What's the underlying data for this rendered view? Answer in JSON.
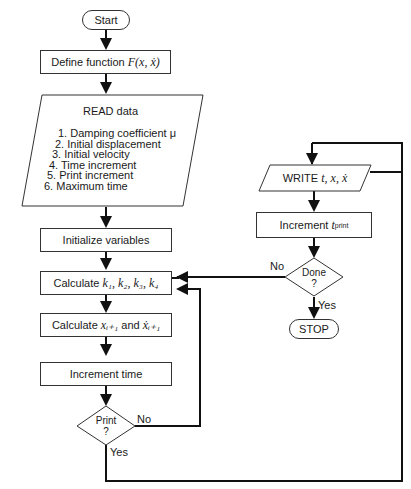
{
  "diagram": {
    "type": "flowchart",
    "nodes": {
      "start": "Start",
      "define": {
        "text": "Define function",
        "math": "F(x, ẋ)"
      },
      "read": {
        "title": "READ data",
        "items": [
          "1.  Damping coefficient μ",
          "2.  Initial displacement",
          "3.  Initial velocity",
          "4.  Time increment",
          "5.  Print increment",
          "6.  Maximum time"
        ]
      },
      "init": "Initialize variables",
      "calc_k": {
        "text": "Calculate",
        "math": "k₁, k₂, k₃, k₄"
      },
      "calc_x": {
        "text": "Calculate",
        "math1": "xᵢ₊₁",
        "and": "and",
        "math2": "ẋᵢ₊₁"
      },
      "inc_time": "Increment time",
      "print": {
        "line1": "Print",
        "line2": "?"
      },
      "write": {
        "text": "WRITE",
        "math": "t, x, ẋ"
      },
      "inc_print": {
        "text": "Increment",
        "math": "t",
        "sub": "print"
      },
      "done": {
        "line1": "Done",
        "line2": "?"
      },
      "stop": "STOP"
    },
    "edge_labels": {
      "print_no": "No",
      "print_yes": "Yes",
      "done_no": "No",
      "done_yes": "Yes"
    }
  }
}
